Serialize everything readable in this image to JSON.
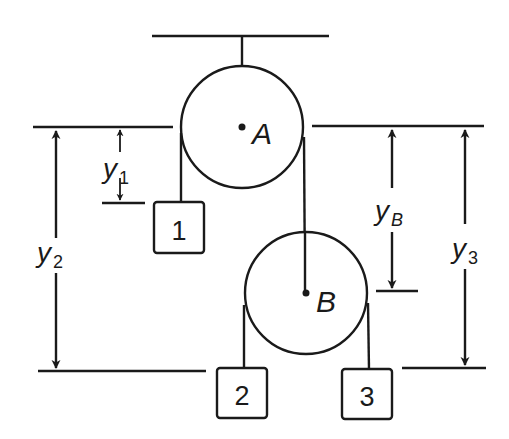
{
  "diagram": {
    "type": "pulley-system",
    "colors": {
      "ink": "#1a1a1a",
      "background": "#ffffff"
    },
    "pulleys": [
      {
        "id": "A",
        "label": "A",
        "fixed": true
      },
      {
        "id": "B",
        "label": "B",
        "fixed": false
      }
    ],
    "blocks": [
      {
        "id": "1",
        "label": "1"
      },
      {
        "id": "2",
        "label": "2"
      },
      {
        "id": "3",
        "label": "3"
      }
    ],
    "dimensions": [
      {
        "id": "y1",
        "var": "y",
        "sub": "1"
      },
      {
        "id": "y2",
        "var": "y",
        "sub": "2"
      },
      {
        "id": "yB",
        "var": "y",
        "sub": "B"
      },
      {
        "id": "y3",
        "var": "y",
        "sub": "3"
      }
    ]
  }
}
